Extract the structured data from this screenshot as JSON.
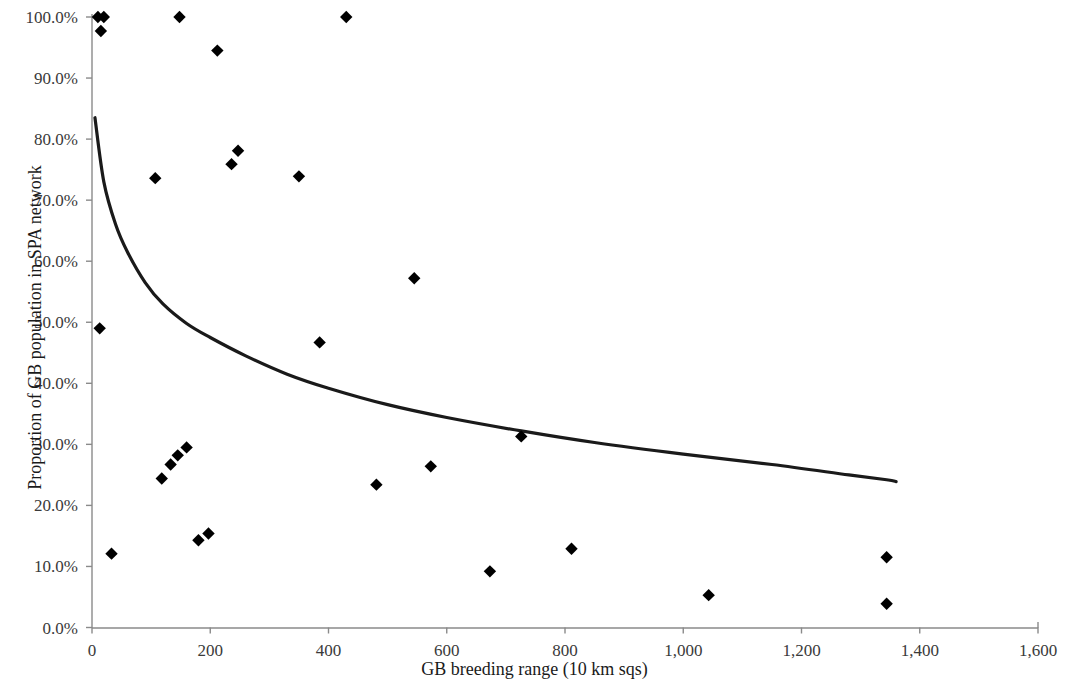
{
  "chart_data": {
    "type": "scatter",
    "title": "",
    "xlabel": "GB breeding range (10 km sqs)",
    "ylabel": "Proportion of GB population in SPA network",
    "xlim": [
      0,
      1600
    ],
    "ylim": [
      0,
      1.0
    ],
    "xticks": [
      0,
      200,
      400,
      600,
      800,
      1000,
      1200,
      1400,
      1600
    ],
    "xtick_labels": [
      "0",
      "200",
      "400",
      "600",
      "800",
      "1,000",
      "1,200",
      "1,400",
      "1,600"
    ],
    "yticks": [
      0,
      10,
      20,
      30,
      40,
      50,
      60,
      70,
      80,
      90,
      100
    ],
    "ytick_labels": [
      "0.0%",
      "10.0%",
      "20.0%",
      "30.0%",
      "40.0%",
      "50.0%",
      "60.0%",
      "70.0%",
      "80.0%",
      "90.0%",
      "100.0%"
    ],
    "grid": false,
    "legend": false,
    "marker": "diamond",
    "marker_color": "#000000",
    "axis_color": "#808080",
    "trendline_color": "#1a1a1a",
    "points": [
      {
        "x": 10,
        "y": 100.0
      },
      {
        "x": 20,
        "y": 100.0
      },
      {
        "x": 15,
        "y": 97.7
      },
      {
        "x": 148,
        "y": 100.0
      },
      {
        "x": 430,
        "y": 100.0
      },
      {
        "x": 212,
        "y": 94.5
      },
      {
        "x": 247,
        "y": 78.1
      },
      {
        "x": 236,
        "y": 75.9
      },
      {
        "x": 350,
        "y": 73.9
      },
      {
        "x": 107,
        "y": 73.6
      },
      {
        "x": 545,
        "y": 57.2
      },
      {
        "x": 13,
        "y": 49.0
      },
      {
        "x": 385,
        "y": 46.7
      },
      {
        "x": 726,
        "y": 31.3
      },
      {
        "x": 160,
        "y": 29.5
      },
      {
        "x": 145,
        "y": 28.2
      },
      {
        "x": 133,
        "y": 26.7
      },
      {
        "x": 573,
        "y": 26.4
      },
      {
        "x": 118,
        "y": 24.4
      },
      {
        "x": 481,
        "y": 23.4
      },
      {
        "x": 197,
        "y": 15.4
      },
      {
        "x": 180,
        "y": 14.3
      },
      {
        "x": 1344,
        "y": 11.5
      },
      {
        "x": 811,
        "y": 12.9
      },
      {
        "x": 33,
        "y": 12.1
      },
      {
        "x": 673,
        "y": 9.2
      },
      {
        "x": 1043,
        "y": 5.3
      },
      {
        "x": 1344,
        "y": 3.9
      }
    ],
    "trendline": {
      "description": "power/logarithmic decay fit",
      "points": [
        {
          "x": 5,
          "y": 83.5
        },
        {
          "x": 20,
          "y": 73.0
        },
        {
          "x": 40,
          "y": 66.0
        },
        {
          "x": 60,
          "y": 61.5
        },
        {
          "x": 90,
          "y": 56.5
        },
        {
          "x": 120,
          "y": 53.0
        },
        {
          "x": 160,
          "y": 49.8
        },
        {
          "x": 200,
          "y": 47.5
        },
        {
          "x": 260,
          "y": 44.5
        },
        {
          "x": 330,
          "y": 41.5
        },
        {
          "x": 400,
          "y": 39.2
        },
        {
          "x": 500,
          "y": 36.5
        },
        {
          "x": 600,
          "y": 34.4
        },
        {
          "x": 726,
          "y": 32.2
        },
        {
          "x": 850,
          "y": 30.3
        },
        {
          "x": 1000,
          "y": 28.4
        },
        {
          "x": 1150,
          "y": 26.7
        },
        {
          "x": 1280,
          "y": 25.0
        },
        {
          "x": 1344,
          "y": 24.2
        },
        {
          "x": 1360,
          "y": 23.9
        }
      ]
    }
  }
}
